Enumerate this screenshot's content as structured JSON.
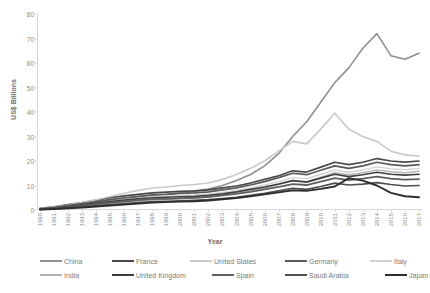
{
  "chart_data": {
    "type": "line",
    "title": "",
    "xlabel": "Year",
    "ylabel": "US$ Billions",
    "ylim": [
      0,
      80
    ],
    "yticks": [
      0,
      10,
      20,
      30,
      40,
      50,
      60,
      70,
      80
    ],
    "grid": false,
    "legend_position": "bottom",
    "x": [
      1990,
      1991,
      1992,
      1993,
      1994,
      1995,
      1996,
      1997,
      1998,
      1999,
      2000,
      2001,
      2002,
      2003,
      2004,
      2005,
      2006,
      2007,
      2008,
      2009,
      2010,
      2011,
      2012,
      2013,
      2014,
      2015,
      2016,
      2017
    ],
    "series": [
      {
        "name": "China",
        "color": "#8f8f8f",
        "width": 1.6,
        "values": [
          0.5,
          1.0,
          1.6,
          2.3,
          3.1,
          3.8,
          4.5,
          5.2,
          6.0,
          6.4,
          7.0,
          7.6,
          8.6,
          10.0,
          12.0,
          14.5,
          18.0,
          23.0,
          30.0,
          36.0,
          44.0,
          52.0,
          58.0,
          66.0,
          72.0,
          63.0,
          61.5,
          64.0
        ]
      },
      {
        "name": "France",
        "color": "#4a4a4a",
        "width": 1.7,
        "values": [
          0.7,
          1.3,
          2.2,
          3.0,
          4.0,
          5.0,
          5.8,
          6.4,
          7.0,
          7.3,
          7.6,
          7.8,
          8.2,
          9.0,
          9.8,
          11.0,
          12.5,
          14.0,
          16.0,
          15.5,
          17.5,
          19.5,
          18.5,
          19.5,
          21.0,
          20.0,
          19.5,
          20.0
        ]
      },
      {
        "name": "United States",
        "color": "#c9c9c9",
        "width": 1.6,
        "values": [
          0.6,
          1.2,
          2.0,
          3.0,
          4.2,
          5.5,
          6.8,
          8.0,
          9.0,
          9.4,
          10.0,
          10.4,
          11.0,
          12.5,
          14.5,
          17.0,
          20.0,
          24.0,
          28.0,
          27.0,
          33.0,
          39.5,
          33.0,
          30.0,
          28.0,
          24.0,
          22.5,
          22.0
        ]
      },
      {
        "name": "Germany",
        "color": "#5a5a5a",
        "width": 1.7,
        "values": [
          0.5,
          1.0,
          1.8,
          2.6,
          3.4,
          4.2,
          5.0,
          5.6,
          6.2,
          6.4,
          6.8,
          7.0,
          7.4,
          8.2,
          9.0,
          10.2,
          11.6,
          13.2,
          15.0,
          14.4,
          16.2,
          18.0,
          17.0,
          18.0,
          19.5,
          18.5,
          18.0,
          18.5
        ]
      },
      {
        "name": "Italy",
        "color": "#d2d2d2",
        "width": 1.4,
        "values": [
          0.4,
          0.8,
          1.4,
          2.0,
          2.8,
          3.5,
          4.2,
          4.8,
          5.4,
          5.6,
          5.9,
          6.1,
          6.5,
          7.2,
          8.0,
          9.0,
          10.2,
          11.6,
          13.2,
          12.8,
          14.6,
          16.4,
          15.4,
          16.4,
          17.6,
          16.8,
          16.4,
          17.0
        ]
      },
      {
        "name": "India",
        "color": "#b3b3b3",
        "width": 1.4,
        "values": [
          0.3,
          0.6,
          1.0,
          1.5,
          2.0,
          2.6,
          3.2,
          3.7,
          4.2,
          4.4,
          4.7,
          4.9,
          5.3,
          6.0,
          6.8,
          7.8,
          9.0,
          10.4,
          12.0,
          11.6,
          13.4,
          15.2,
          14.4,
          15.2,
          16.4,
          15.6,
          15.2,
          15.8
        ]
      },
      {
        "name": "United Kingdom",
        "color": "#3f3f3f",
        "width": 1.7,
        "values": [
          0.4,
          0.9,
          1.5,
          2.1,
          2.8,
          3.4,
          4.0,
          4.5,
          5.0,
          5.2,
          5.4,
          5.6,
          6.0,
          6.6,
          7.4,
          8.4,
          9.4,
          10.6,
          12.0,
          11.4,
          13.0,
          14.6,
          13.6,
          14.4,
          15.4,
          14.6,
          14.2,
          14.6
        ]
      },
      {
        "name": "Spain",
        "color": "#5f5f5f",
        "width": 1.8,
        "values": [
          0.3,
          0.7,
          1.2,
          1.8,
          2.4,
          3.0,
          3.5,
          4.0,
          4.4,
          4.6,
          4.8,
          5.0,
          5.4,
          6.0,
          6.6,
          7.4,
          8.4,
          9.4,
          10.6,
          10.2,
          11.6,
          13.0,
          12.2,
          12.8,
          13.6,
          12.8,
          12.4,
          12.6
        ]
      },
      {
        "name": "Saudi Arabia",
        "color": "#4f4f4f",
        "width": 1.7,
        "values": [
          0.2,
          0.5,
          0.9,
          1.3,
          1.8,
          2.2,
          2.6,
          3.0,
          3.4,
          3.5,
          3.7,
          3.9,
          4.2,
          4.7,
          5.2,
          6.0,
          6.8,
          7.8,
          8.8,
          8.4,
          9.6,
          11.0,
          10.2,
          10.6,
          11.2,
          10.4,
          9.8,
          10.0
        ]
      },
      {
        "name": "Japan",
        "color": "#2e2e2e",
        "width": 1.9,
        "values": [
          0.2,
          0.4,
          0.7,
          1.0,
          1.4,
          1.8,
          2.2,
          2.6,
          3.0,
          3.2,
          3.4,
          3.6,
          3.9,
          4.4,
          4.9,
          5.6,
          6.4,
          7.2,
          8.0,
          7.8,
          8.6,
          9.6,
          13.0,
          12.0,
          10.0,
          7.0,
          5.6,
          5.2
        ]
      }
    ]
  },
  "legend": {
    "rows": [
      [
        {
          "label": "China"
        },
        {
          "label": "France"
        },
        {
          "label": "United States"
        },
        {
          "label": "Germany"
        },
        {
          "label": "Italy"
        }
      ],
      [
        {
          "label": "India"
        },
        {
          "label": "United Kingdom"
        },
        {
          "label": "Spain"
        },
        {
          "label": "Saudi Arabia"
        },
        {
          "label": "Japan"
        }
      ]
    ]
  }
}
